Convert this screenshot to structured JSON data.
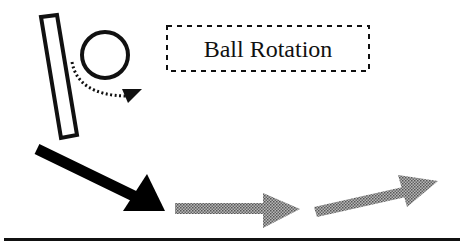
{
  "diagram": {
    "label": "Ball Rotation",
    "elements": [
      {
        "name": "paddle",
        "shape": "rectangle",
        "style": "outlined"
      },
      {
        "name": "ball",
        "shape": "circle",
        "style": "outlined"
      },
      {
        "name": "rotation-path",
        "shape": "curved-arrow",
        "style": "dotted"
      },
      {
        "name": "incoming-arrow",
        "shape": "arrow",
        "color": "#000000"
      },
      {
        "name": "outgoing-arrow-1",
        "shape": "arrow",
        "color": "#8a8a8a"
      },
      {
        "name": "outgoing-arrow-2",
        "shape": "arrow",
        "color": "#8a8a8a"
      }
    ],
    "colors": {
      "ink": "#111111",
      "shaded": "#8a8a8a"
    }
  }
}
